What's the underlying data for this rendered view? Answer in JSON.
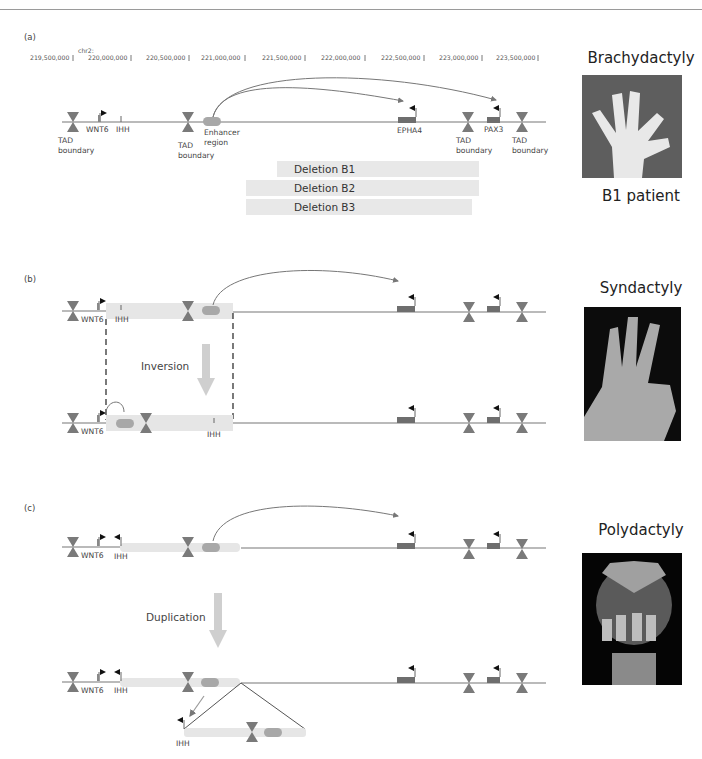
{
  "figure": {
    "panels": [
      {
        "id": "a",
        "label": "(a)",
        "chromosome_label": "chr2:",
        "coordinates": [
          "219,500,000",
          "220,000,000",
          "220,500,000",
          "221,000,000",
          "221,500,000",
          "222,000,000",
          "222,500,000",
          "223,000,000",
          "223,500,000"
        ],
        "genes": {
          "wnt6": "WNT6",
          "ihh": "IHH",
          "epha4": "EPHA4",
          "pax3": "PAX3"
        },
        "tad_boundary_line1": "TAD",
        "tad_boundary_line2": "boundary",
        "enhancer_line1": "Enhancer",
        "enhancer_line2": "region",
        "deletions": [
          "Deletion B1",
          "Deletion B2",
          "Deletion B3"
        ],
        "phenotype": "Brachydactyly",
        "caption": "B1 patient"
      },
      {
        "id": "b",
        "label": "(b)",
        "genes": {
          "wnt6": "WNT6",
          "ihh": "IHH"
        },
        "operation": "Inversion",
        "phenotype": "Syndactyly"
      },
      {
        "id": "c",
        "label": "(c)",
        "genes": {
          "wnt6": "WNT6",
          "ihh": "IHH"
        },
        "operation": "Duplication",
        "phenotype": "Polydactyly"
      }
    ],
    "colors": {
      "tad_boundary": "#7a7a7a",
      "gene_box": "#6e6e6e",
      "enhancer": "#a8a8a8",
      "highlight_band": "#e6e6e6",
      "deletion_bar": "#e8e8e8",
      "arrow": "#cfcfcf",
      "line": "#555555"
    },
    "icons": {
      "tad_boundary": "hourglass-icon",
      "promoter": "flag-arrow-icon",
      "enhancer": "pill-icon",
      "photo": "hand-photo-icon"
    }
  }
}
